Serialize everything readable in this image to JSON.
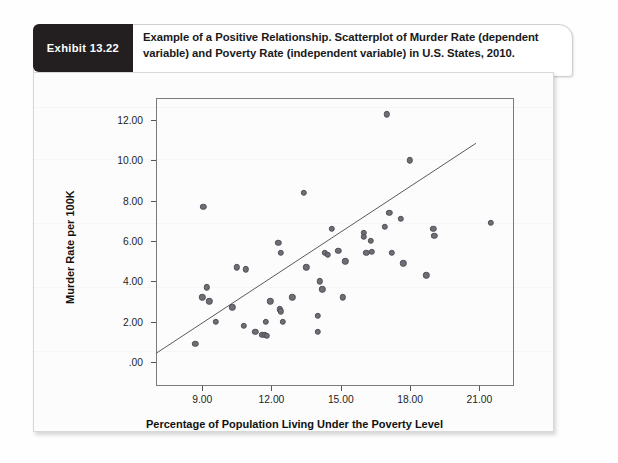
{
  "exhibit": {
    "badge_label": "Exhibit 13.22",
    "caption": "Example of a Positive Relationship. Scatterplot of Murder Rate (dependent variable) and Poverty Rate (independent variable) in U.S. States, 2010."
  },
  "colors": {
    "badge_bg": "#231f20",
    "point_fill": "#6e6e75",
    "point_stroke": "#4f4f57",
    "frame": "#7a7a7a",
    "panel_bg": "#fcfcfc"
  },
  "chart_data": {
    "type": "scatter",
    "title": "",
    "xlabel": "Percentage of Population Living Under the Poverty Level",
    "ylabel": "Murder Rate per 100K",
    "xlim": [
      7.0,
      22.5
    ],
    "ylim": [
      -1.2,
      13.1
    ],
    "xticks": [
      9,
      12,
      15,
      18,
      21
    ],
    "xtick_labels": [
      "9.00",
      "12.00",
      "15.00",
      "18.00",
      "21.00"
    ],
    "yticks": [
      0,
      2,
      4,
      6,
      8,
      10,
      12
    ],
    "ytick_labels": [
      ".00",
      "2.00",
      "4.00",
      "6.00",
      "8.00",
      "10.00",
      "12.00"
    ],
    "grid": false,
    "legend": "none",
    "series": [
      {
        "name": "U.S. States, 2010",
        "points": [
          [
            8.7,
            0.9
          ],
          [
            9.0,
            3.2
          ],
          [
            9.05,
            7.7
          ],
          [
            9.2,
            3.7
          ],
          [
            9.3,
            3.0
          ],
          [
            9.6,
            2.0
          ],
          [
            10.3,
            2.7
          ],
          [
            10.5,
            4.7
          ],
          [
            10.8,
            1.8
          ],
          [
            10.9,
            4.6
          ],
          [
            11.3,
            1.5
          ],
          [
            11.6,
            1.35
          ],
          [
            11.7,
            1.35
          ],
          [
            11.8,
            1.3
          ],
          [
            11.75,
            2.0
          ],
          [
            11.95,
            3.0
          ],
          [
            12.3,
            5.9
          ],
          [
            12.35,
            2.6
          ],
          [
            12.4,
            2.5
          ],
          [
            12.4,
            5.4
          ],
          [
            12.5,
            2.0
          ],
          [
            12.9,
            3.2
          ],
          [
            13.4,
            8.4
          ],
          [
            13.5,
            4.7
          ],
          [
            14.0,
            2.3
          ],
          [
            14.0,
            1.5
          ],
          [
            14.1,
            4.0
          ],
          [
            14.2,
            3.6
          ],
          [
            14.3,
            5.4
          ],
          [
            14.45,
            5.3
          ],
          [
            14.6,
            6.6
          ],
          [
            14.9,
            5.5
          ],
          [
            15.1,
            3.2
          ],
          [
            15.2,
            5.0
          ],
          [
            16.0,
            6.4
          ],
          [
            16.0,
            6.2
          ],
          [
            16.1,
            5.4
          ],
          [
            16.3,
            6.0
          ],
          [
            16.35,
            5.45
          ],
          [
            16.9,
            6.7
          ],
          [
            17.0,
            12.3
          ],
          [
            17.1,
            7.4
          ],
          [
            17.2,
            5.4
          ],
          [
            17.6,
            7.1
          ],
          [
            17.7,
            4.9
          ],
          [
            18.0,
            10.0
          ],
          [
            18.7,
            4.3
          ],
          [
            19.0,
            6.6
          ],
          [
            19.05,
            6.25
          ],
          [
            21.5,
            6.9
          ]
        ]
      }
    ],
    "fit_line": {
      "name": "linear-regression-line",
      "x_start": 7.0,
      "y_start": 0.42,
      "x_end": 20.85,
      "y_end": 10.85
    }
  }
}
